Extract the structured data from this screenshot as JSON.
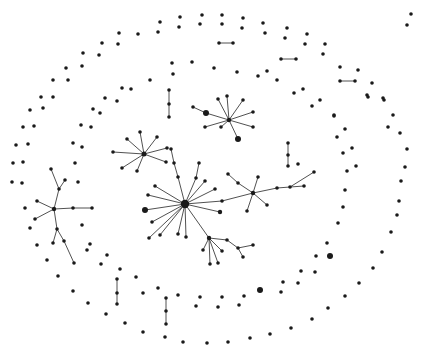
{
  "figure": {
    "width": 421,
    "height": 355,
    "background": "#ffffff",
    "node_color": "#1a1a1a",
    "edge_color": "#3d3d3d",
    "default_node_radius": 1.8,
    "edge_width": 0.9
  },
  "graph": {
    "nodes": [
      [
        185,
        204,
        4.2
      ],
      [
        178,
        177
      ],
      [
        174,
        163
      ],
      [
        171,
        149
      ],
      [
        196,
        178
      ],
      [
        199,
        163
      ],
      [
        205,
        181
      ],
      [
        215,
        189
      ],
      [
        222,
        201
      ],
      [
        253,
        193,
        2.2
      ],
      [
        220,
        212,
        2.2
      ],
      [
        155,
        186
      ],
      [
        148,
        195
      ],
      [
        145,
        210,
        3
      ],
      [
        152,
        222
      ],
      [
        160,
        235
      ],
      [
        149,
        238
      ],
      [
        178,
        234
      ],
      [
        186,
        237
      ],
      [
        209,
        238,
        2.2
      ],
      [
        238,
        183
      ],
      [
        228,
        174
      ],
      [
        258,
        177
      ],
      [
        247,
        211
      ],
      [
        267,
        205
      ],
      [
        277,
        188
      ],
      [
        290,
        187
      ],
      [
        304,
        186
      ],
      [
        314,
        172
      ],
      [
        203,
        250
      ],
      [
        210,
        264
      ],
      [
        218,
        263
      ],
      [
        222,
        251
      ],
      [
        227,
        240
      ],
      [
        238,
        248
      ],
      [
        253,
        245
      ],
      [
        243,
        257
      ],
      [
        54,
        209,
        2.2
      ],
      [
        37,
        201
      ],
      [
        35,
        219
      ],
      [
        73,
        208
      ],
      [
        92,
        208
      ],
      [
        59,
        189
      ],
      [
        51,
        169
      ],
      [
        65,
        180
      ],
      [
        57,
        229
      ],
      [
        53,
        243
      ],
      [
        64,
        241
      ],
      [
        74,
        263
      ],
      [
        144,
        154,
        2.5
      ],
      [
        140,
        132
      ],
      [
        127,
        139
      ],
      [
        113,
        152
      ],
      [
        122,
        168
      ],
      [
        137,
        171
      ],
      [
        157,
        137
      ],
      [
        167,
        148
      ],
      [
        166,
        162
      ],
      [
        229,
        120,
        2.2
      ],
      [
        206,
        113,
        3
      ],
      [
        193,
        107
      ],
      [
        218,
        99
      ],
      [
        227,
        96
      ],
      [
        243,
        100
      ],
      [
        253,
        112
      ],
      [
        253,
        127
      ],
      [
        221,
        127
      ],
      [
        205,
        127
      ],
      [
        238,
        139,
        3
      ],
      [
        219,
        43
      ],
      [
        233,
        43
      ],
      [
        281,
        59
      ],
      [
        296,
        59
      ],
      [
        340,
        81
      ],
      [
        355,
        81
      ],
      [
        169,
        90
      ],
      [
        169,
        104
      ],
      [
        169,
        117
      ],
      [
        288,
        143
      ],
      [
        288,
        155
      ],
      [
        288,
        166
      ],
      [
        117,
        279
      ],
      [
        117,
        293
      ],
      [
        117,
        304
      ],
      [
        166,
        298
      ],
      [
        166,
        311
      ],
      [
        166,
        324
      ],
      [
        119,
        33
      ],
      [
        138,
        34
      ],
      [
        102,
        43
      ],
      [
        118,
        44
      ],
      [
        83,
        53
      ],
      [
        99,
        55
      ],
      [
        82,
        66
      ],
      [
        66,
        68
      ],
      [
        68,
        80
      ],
      [
        53,
        80
      ],
      [
        41,
        97
      ],
      [
        53,
        97
      ],
      [
        30,
        110
      ],
      [
        43,
        108
      ],
      [
        93,
        109
      ],
      [
        100,
        113
      ],
      [
        122,
        88
      ],
      [
        131,
        89
      ],
      [
        105,
        98
      ],
      [
        117,
        101
      ],
      [
        160,
        22
      ],
      [
        180,
        17
      ],
      [
        202,
        15
      ],
      [
        222,
        15
      ],
      [
        243,
        18
      ],
      [
        158,
        32
      ],
      [
        179,
        27
      ],
      [
        200,
        24
      ],
      [
        222,
        24
      ],
      [
        242,
        28
      ],
      [
        263,
        23
      ],
      [
        265,
        33
      ],
      [
        172,
        63
      ],
      [
        192,
        62
      ],
      [
        214,
        68
      ],
      [
        237,
        72
      ],
      [
        258,
        76
      ],
      [
        267,
        71
      ],
      [
        173,
        74
      ],
      [
        150,
        80
      ],
      [
        277,
        80
      ],
      [
        287,
        28
      ],
      [
        285,
        38
      ],
      [
        307,
        34
      ],
      [
        305,
        44
      ],
      [
        325,
        44
      ],
      [
        323,
        54
      ],
      [
        340,
        67
      ],
      [
        358,
        70
      ],
      [
        372,
        83
      ],
      [
        367,
        95
      ],
      [
        383,
        98
      ],
      [
        294,
        93
      ],
      [
        303,
        89
      ],
      [
        312,
        106
      ],
      [
        320,
        100
      ],
      [
        334,
        115
      ],
      [
        411,
        14
      ],
      [
        407,
        25
      ],
      [
        368,
        97
      ],
      [
        384,
        100
      ],
      [
        393,
        115
      ],
      [
        334,
        116
      ],
      [
        345,
        129
      ],
      [
        337,
        137
      ],
      [
        388,
        127
      ],
      [
        400,
        133
      ],
      [
        352,
        148
      ],
      [
        343,
        153
      ],
      [
        407,
        149
      ],
      [
        356,
        166
      ],
      [
        405,
        167
      ],
      [
        347,
        171
      ],
      [
        401,
        181
      ],
      [
        345,
        190
      ],
      [
        399,
        201
      ],
      [
        343,
        207
      ],
      [
        397,
        215
      ],
      [
        391,
        232
      ],
      [
        338,
        223
      ],
      [
        327,
        243
      ],
      [
        330,
        256,
        3
      ],
      [
        316,
        256
      ],
      [
        382,
        252
      ],
      [
        301,
        271
      ],
      [
        315,
        272
      ],
      [
        373,
        268
      ],
      [
        283,
        282
      ],
      [
        298,
        283
      ],
      [
        359,
        283
      ],
      [
        345,
        296
      ],
      [
        281,
        292
      ],
      [
        328,
        308
      ],
      [
        312,
        319
      ],
      [
        291,
        328
      ],
      [
        143,
        293
      ],
      [
        158,
        288
      ],
      [
        178,
        295
      ],
      [
        196,
        306
      ],
      [
        218,
        307
      ],
      [
        200,
        297
      ],
      [
        222,
        297
      ],
      [
        239,
        305
      ],
      [
        244,
        296
      ],
      [
        260,
        290,
        3
      ],
      [
        143,
        332
      ],
      [
        165,
        337
      ],
      [
        183,
        342
      ],
      [
        207,
        343
      ],
      [
        228,
        342
      ],
      [
        250,
        338
      ],
      [
        270,
        334
      ],
      [
        37,
        245
      ],
      [
        87,
        250
      ],
      [
        47,
        260
      ],
      [
        58,
        276
      ],
      [
        107,
        255
      ],
      [
        101,
        264
      ],
      [
        120,
        269
      ],
      [
        73,
        291
      ],
      [
        88,
        303
      ],
      [
        106,
        314
      ],
      [
        125,
        323
      ],
      [
        136,
        277
      ],
      [
        23,
        127
      ],
      [
        34,
        126
      ],
      [
        16,
        145
      ],
      [
        28,
        144
      ],
      [
        13,
        163
      ],
      [
        23,
        162
      ],
      [
        12,
        182
      ],
      [
        22,
        183
      ],
      [
        81,
        125
      ],
      [
        91,
        127
      ],
      [
        73,
        143
      ],
      [
        82,
        147
      ],
      [
        75,
        163
      ],
      [
        78,
        182
      ],
      [
        25,
        208
      ],
      [
        30,
        228
      ],
      [
        82,
        225
      ],
      [
        90,
        244
      ],
      [
        298,
        164
      ]
    ],
    "edges": [
      [
        0,
        1
      ],
      [
        1,
        2
      ],
      [
        2,
        3
      ],
      [
        0,
        4
      ],
      [
        4,
        5
      ],
      [
        0,
        6
      ],
      [
        0,
        7
      ],
      [
        0,
        8
      ],
      [
        8,
        9
      ],
      [
        0,
        10
      ],
      [
        0,
        11
      ],
      [
        0,
        12
      ],
      [
        0,
        13
      ],
      [
        0,
        14
      ],
      [
        0,
        15
      ],
      [
        0,
        16
      ],
      [
        0,
        17
      ],
      [
        0,
        18
      ],
      [
        0,
        19
      ],
      [
        9,
        20
      ],
      [
        20,
        21
      ],
      [
        9,
        22
      ],
      [
        9,
        23
      ],
      [
        9,
        24
      ],
      [
        9,
        25
      ],
      [
        25,
        26
      ],
      [
        26,
        27
      ],
      [
        26,
        28
      ],
      [
        19,
        29
      ],
      [
        19,
        30
      ],
      [
        19,
        31
      ],
      [
        19,
        32
      ],
      [
        19,
        33
      ],
      [
        33,
        34
      ],
      [
        34,
        35
      ],
      [
        34,
        36
      ],
      [
        37,
        38
      ],
      [
        37,
        39
      ],
      [
        37,
        40
      ],
      [
        40,
        41
      ],
      [
        37,
        42
      ],
      [
        42,
        43
      ],
      [
        42,
        44
      ],
      [
        37,
        45
      ],
      [
        45,
        46
      ],
      [
        45,
        47
      ],
      [
        47,
        48
      ],
      [
        49,
        50
      ],
      [
        49,
        51
      ],
      [
        49,
        52
      ],
      [
        49,
        53
      ],
      [
        49,
        54
      ],
      [
        49,
        55
      ],
      [
        49,
        56
      ],
      [
        49,
        57
      ],
      [
        58,
        59
      ],
      [
        59,
        60
      ],
      [
        58,
        61
      ],
      [
        58,
        62
      ],
      [
        58,
        63
      ],
      [
        58,
        64
      ],
      [
        58,
        65
      ],
      [
        58,
        66
      ],
      [
        58,
        67
      ],
      [
        58,
        68
      ],
      [
        69,
        70
      ],
      [
        71,
        72
      ],
      [
        73,
        74
      ],
      [
        75,
        76
      ],
      [
        76,
        77
      ],
      [
        78,
        79
      ],
      [
        79,
        80
      ],
      [
        81,
        82
      ],
      [
        82,
        83
      ],
      [
        84,
        85
      ],
      [
        85,
        86
      ]
    ]
  }
}
